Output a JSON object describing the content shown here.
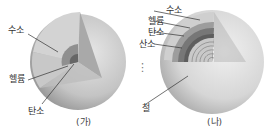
{
  "figures": [
    {
      "id": "ga",
      "caption": "(가)",
      "labels": {
        "hydrogen": "수소",
        "helium": "헬륨",
        "carbon": "탄소"
      }
    },
    {
      "id": "na",
      "caption": "(나)",
      "labels": {
        "hydrogen": "수소",
        "helium": "헬륨",
        "carbon": "탄소",
        "oxygen": "산소",
        "ellipsis": "⋮",
        "iron": "철"
      }
    }
  ]
}
